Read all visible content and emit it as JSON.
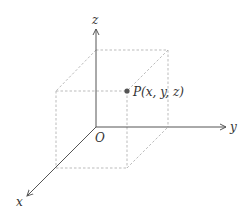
{
  "diagram": {
    "origin_label": "O",
    "axes": {
      "x_label": "x",
      "y_label": "y",
      "z_label": "z"
    },
    "point": {
      "label": "P(x, y, z)",
      "color": "#555555"
    },
    "colors": {
      "axis": "#555555",
      "dashed": "#aaaaaa",
      "text": "#333333"
    }
  }
}
